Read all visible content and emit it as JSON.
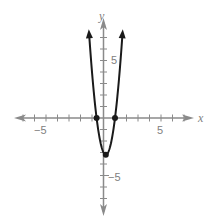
{
  "chart_data": {
    "type": "line",
    "title": "",
    "xlabel": "x",
    "ylabel": "y",
    "xlim": [
      -7,
      7
    ],
    "ylim": [
      -7,
      8
    ],
    "grid": false,
    "x_tick_labels": [
      "−5",
      "5"
    ],
    "y_tick_labels": [
      "5",
      "−5"
    ],
    "tick_spacing": 1,
    "series": [
      {
        "name": "parabola",
        "equation_estimate": "y = 5(x + 0.6)(x − 1)",
        "vertex": [
          0.2,
          -3.2
        ],
        "x_intercepts": [
          -0.6,
          1.0
        ],
        "opens": "up",
        "arrows_at_ends": true
      }
    ],
    "marked_points": [
      {
        "x": -0.6,
        "y": 0
      },
      {
        "x": 1.0,
        "y": 0
      },
      {
        "x": 0.2,
        "y": -3.2
      }
    ]
  },
  "labels": {
    "x_axis": "x",
    "y_axis": "y",
    "x_neg5": "−5",
    "x_pos5": "5",
    "y_pos5": "5",
    "y_neg5": "−5"
  },
  "colors": {
    "axis": "#8a8a8a",
    "curve": "#1a1a1a",
    "label": "#808080"
  }
}
